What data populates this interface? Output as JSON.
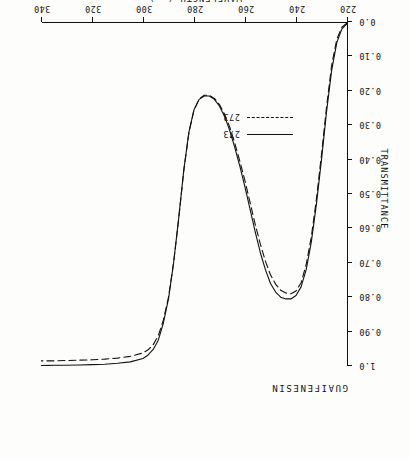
{
  "chart_title": "GUAIFENESIN",
  "axes": {
    "x_title": "WAVELENGTH  (nm)",
    "y_title": "TRANSMITTANCE",
    "x_ticklabels": [
      "220",
      "240",
      "260",
      "280",
      "300",
      "320",
      "340"
    ],
    "y_ticklabels": [
      "0.0",
      "0.10",
      "0.20",
      "0.30",
      "0.40",
      "0.50",
      "0.60",
      "0.70",
      "0.80",
      "0.90",
      "1.0"
    ]
  },
  "legend": {
    "entries": [
      {
        "label": "273",
        "style": "solid"
      },
      {
        "label": "273",
        "style": "dashed"
      }
    ]
  },
  "colors": {
    "ink": "#111111",
    "paper": "#fdfdfb"
  },
  "chart_data": {
    "type": "line",
    "title": "GUAIFENESIN",
    "xlabel": "WAVELENGTH  (nm)",
    "ylabel": "TRANSMITTANCE",
    "xlim": [
      220,
      340
    ],
    "ylim": [
      0.0,
      1.0
    ],
    "xticks": [
      220,
      240,
      260,
      280,
      300,
      320,
      340
    ],
    "yticks": [
      0.0,
      0.1,
      0.2,
      0.3,
      0.4,
      0.5,
      0.6,
      0.7,
      0.8,
      0.9,
      1.0
    ],
    "grid": false,
    "legend_position": "center-right",
    "annotations": [
      "Spectrum rotated 180 degrees in the original scan"
    ],
    "series": [
      {
        "name": "273",
        "style": "solid",
        "x": [
          220,
          222,
          224,
          226,
          228,
          230,
          232,
          234,
          236,
          238,
          240,
          242,
          244,
          246,
          248,
          250,
          252,
          254,
          256,
          258,
          260,
          262,
          264,
          266,
          268,
          270,
          272,
          274,
          276,
          278,
          280,
          282,
          284,
          286,
          288,
          290,
          292,
          294,
          296,
          298,
          300,
          305,
          310,
          315,
          320,
          325,
          330,
          335,
          340
        ],
        "y": [
          0.005,
          0.02,
          0.06,
          0.14,
          0.26,
          0.4,
          0.53,
          0.64,
          0.72,
          0.77,
          0.795,
          0.805,
          0.805,
          0.8,
          0.785,
          0.76,
          0.72,
          0.67,
          0.61,
          0.545,
          0.48,
          0.42,
          0.365,
          0.315,
          0.275,
          0.245,
          0.225,
          0.215,
          0.215,
          0.225,
          0.255,
          0.32,
          0.43,
          0.57,
          0.7,
          0.805,
          0.875,
          0.925,
          0.952,
          0.968,
          0.978,
          0.988,
          0.992,
          0.995,
          0.996,
          0.997,
          0.998,
          0.998,
          0.999
        ]
      },
      {
        "name": "273",
        "style": "dashed",
        "x": [
          220,
          222,
          224,
          226,
          228,
          230,
          232,
          234,
          236,
          238,
          240,
          242,
          244,
          246,
          248,
          250,
          252,
          254,
          256,
          258,
          260,
          262,
          264,
          266,
          268,
          270,
          272,
          274,
          276,
          278,
          280,
          282,
          284,
          286,
          288,
          290,
          292,
          294,
          296,
          298,
          300,
          305,
          310,
          315,
          320,
          325,
          330,
          335,
          340
        ],
        "y": [
          0.003,
          0.015,
          0.05,
          0.125,
          0.245,
          0.385,
          0.515,
          0.625,
          0.705,
          0.758,
          0.782,
          0.79,
          0.788,
          0.78,
          0.762,
          0.735,
          0.695,
          0.645,
          0.588,
          0.525,
          0.462,
          0.405,
          0.352,
          0.305,
          0.268,
          0.24,
          0.222,
          0.213,
          0.213,
          0.224,
          0.256,
          0.322,
          0.432,
          0.572,
          0.7,
          0.8,
          0.866,
          0.912,
          0.938,
          0.953,
          0.962,
          0.972,
          0.977,
          0.98,
          0.982,
          0.983,
          0.984,
          0.985,
          0.985
        ]
      }
    ]
  }
}
